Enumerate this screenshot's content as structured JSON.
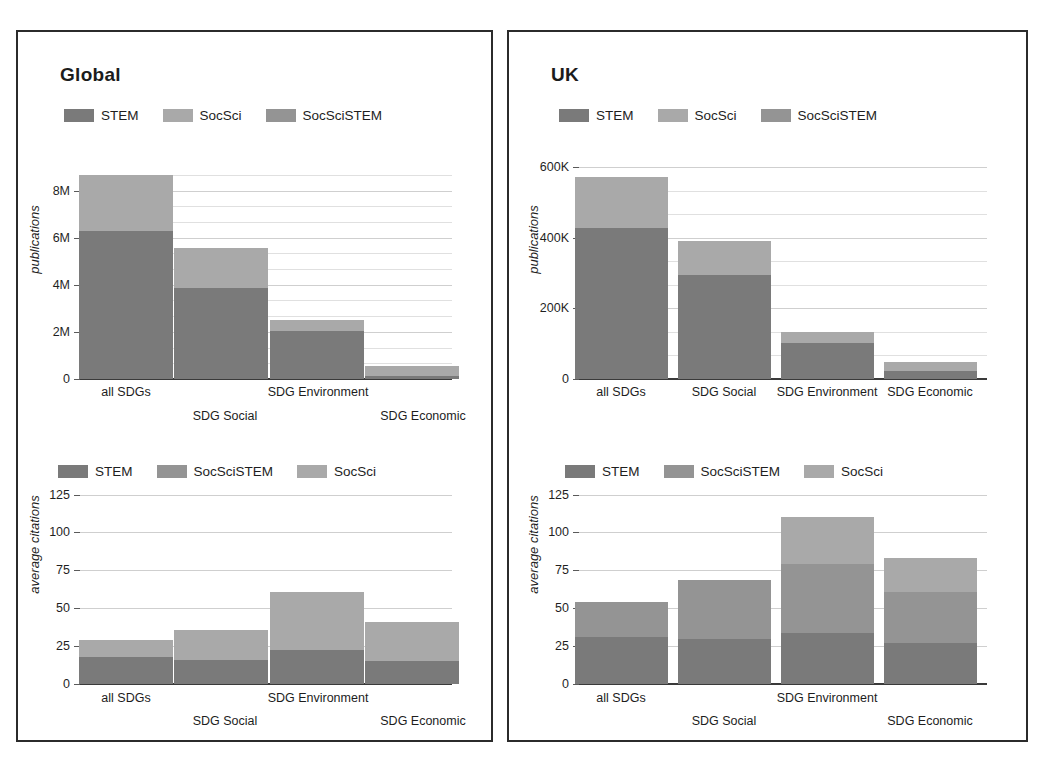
{
  "figure": {
    "clipped_heading": "",
    "panels": [
      {
        "key": "global",
        "title": "Global"
      },
      {
        "key": "uk",
        "title": "UK"
      }
    ]
  },
  "colors": {
    "stem": "#7a7a7a",
    "socsci": "#a9a9a9",
    "socscistem": "#949494",
    "grid": "#cfcfcf",
    "axis": "#3a3a3a",
    "frame": "#2b2b2b",
    "text": "#1e1e1e"
  },
  "chart_data": [
    {
      "id": "global-publications",
      "type": "bar",
      "stacked": true,
      "panel": "Global",
      "title": "Global",
      "xlabel": "",
      "ylabel": "publications",
      "categories": [
        "all SDGs",
        "SDG Social",
        "SDG Environment",
        "SDG Economic"
      ],
      "ylim": [
        0,
        9000000
      ],
      "yticks": [
        0,
        2000000,
        4000000,
        6000000,
        8000000
      ],
      "ytick_labels": [
        "0",
        "2M",
        "4M",
        "6M",
        "8M"
      ],
      "minor_grid": true,
      "legend_position": "top-left",
      "legend": [
        "STEM",
        "SocSci",
        "SocSciSTEM"
      ],
      "series": [
        {
          "name": "STEM",
          "color": "#7a7a7a",
          "values": [
            6300000,
            3880000,
            2050000,
            130000
          ]
        },
        {
          "name": "SocSciSTEM",
          "color": "#949494",
          "values": [
            0,
            0,
            0,
            0
          ]
        },
        {
          "name": "SocSci",
          "color": "#a9a9a9",
          "values": [
            2380000,
            1700000,
            450000,
            420000
          ]
        }
      ],
      "totals": [
        8680000,
        5580000,
        2500000,
        550000
      ]
    },
    {
      "id": "global-citations",
      "type": "bar",
      "stacked": true,
      "panel": "Global",
      "title": "",
      "xlabel": "",
      "ylabel": "average citations",
      "categories": [
        "all SDGs",
        "SDG Social",
        "SDG Environment",
        "SDG Economic"
      ],
      "ylim": [
        0,
        132
      ],
      "yticks": [
        0,
        25,
        50,
        75,
        100,
        125
      ],
      "ytick_labels": [
        "0",
        "25",
        "50",
        "75",
        "100",
        "125"
      ],
      "minor_grid": false,
      "legend_position": "top-left",
      "legend": [
        "STEM",
        "SocSciSTEM",
        "SocSci"
      ],
      "series": [
        {
          "name": "STEM",
          "color": "#7a7a7a",
          "values": [
            18,
            16,
            22.5,
            15
          ]
        },
        {
          "name": "SocSciSTEM",
          "color": "#949494",
          "values": [
            0,
            0,
            0,
            0
          ]
        },
        {
          "name": "SocSci",
          "color": "#a9a9a9",
          "values": [
            11,
            19.5,
            38,
            26
          ]
        }
      ],
      "totals": [
        29,
        35.5,
        60.5,
        41
      ]
    },
    {
      "id": "uk-publications",
      "type": "bar",
      "stacked": true,
      "panel": "UK",
      "title": "UK",
      "xlabel": "",
      "ylabel": "publications",
      "categories": [
        "all SDGs",
        "SDG Social",
        "SDG Environment",
        "SDG Economic"
      ],
      "ylim": [
        0,
        600000
      ],
      "yticks": [
        0,
        200000,
        400000,
        600000
      ],
      "ytick_labels": [
        "0",
        "200K",
        "400K",
        "600K"
      ],
      "minor_grid": true,
      "legend_position": "top-left",
      "legend": [
        "STEM",
        "SocSci",
        "SocSciSTEM"
      ],
      "series": [
        {
          "name": "STEM",
          "color": "#7a7a7a",
          "values": [
            428000,
            293000,
            103000,
            22000
          ]
        },
        {
          "name": "SocSciSTEM",
          "color": "#949494",
          "values": [
            0,
            0,
            0,
            0
          ]
        },
        {
          "name": "SocSci",
          "color": "#a9a9a9",
          "values": [
            145000,
            97000,
            30000,
            25000
          ]
        }
      ],
      "totals": [
        573000,
        390000,
        133000,
        47000
      ]
    },
    {
      "id": "uk-citations",
      "type": "bar",
      "stacked": true,
      "panel": "UK",
      "title": "",
      "xlabel": "",
      "ylabel": "average citations",
      "categories": [
        "all SDGs",
        "SDG Social",
        "SDG Environment",
        "SDG Economic"
      ],
      "ylim": [
        0,
        132
      ],
      "yticks": [
        0,
        25,
        50,
        75,
        100,
        125
      ],
      "ytick_labels": [
        "0",
        "25",
        "50",
        "75",
        "100",
        "125"
      ],
      "minor_grid": false,
      "legend_position": "top-left",
      "legend": [
        "STEM",
        "SocSciSTEM",
        "SocSci"
      ],
      "series": [
        {
          "name": "STEM",
          "color": "#7a7a7a",
          "values": [
            31,
            29.5,
            34,
            27
          ]
        },
        {
          "name": "SocSciSTEM",
          "color": "#949494",
          "values": [
            23,
            39,
            45,
            34
          ]
        },
        {
          "name": "SocSci",
          "color": "#a9a9a9",
          "values": [
            0,
            0,
            31,
            22
          ]
        }
      ],
      "totals": [
        54,
        68.5,
        110,
        83
      ]
    }
  ]
}
